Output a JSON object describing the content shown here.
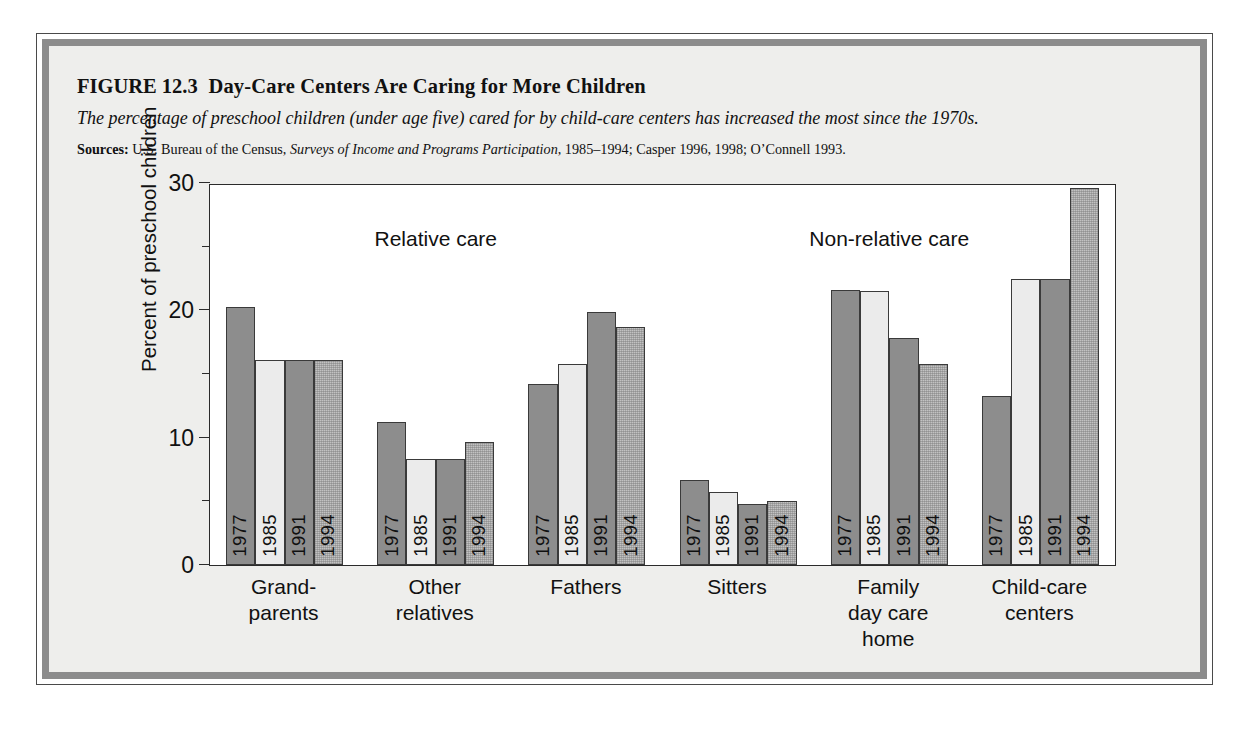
{
  "figure": {
    "label": "FIGURE 12.3",
    "title": "Day-Care Centers Are Caring for More Children",
    "subtitle": "The percentage of preschool children (under age five) cared for by child-care centers has increased the most since the 1970s.",
    "sources_label": "Sources:",
    "sources_part1": "U.S. Bureau of the Census,",
    "sources_italic": "Surveys of Income and Programs Participation",
    "sources_part2": ", 1985–1994; Casper 1996, 1998; O’Connell 1993."
  },
  "chart_data": {
    "type": "bar",
    "title": "Day-Care Centers Are Caring for More Children",
    "subtitle": "The percentage of preschool children (under age five) cared for by child-care centers has increased the most since the 1970s.",
    "xlabel": "",
    "ylabel": "Percent of preschool children",
    "ylim": [
      0,
      30
    ],
    "yticks": [
      0,
      10,
      20,
      30
    ],
    "ytick_labels": [
      "0",
      "10",
      "20",
      "30"
    ],
    "yminor_ticks": [
      5,
      15,
      25
    ],
    "grid": false,
    "legend_position": "none",
    "categories": [
      "Grand-\nparents",
      "Other\nrelatives",
      "Fathers",
      "Sitters",
      "Family\nday care\nhome",
      "Child-care\ncenters"
    ],
    "series": [
      {
        "name": "1977",
        "values": [
          20.3,
          11.2,
          14.2,
          6.7,
          21.6,
          13.3
        ],
        "color": "#8d8d8d"
      },
      {
        "name": "1985",
        "values": [
          16.1,
          8.3,
          15.8,
          5.7,
          21.5,
          22.5
        ],
        "color": "#ebebeb"
      },
      {
        "name": "1991",
        "values": [
          16.1,
          8.3,
          19.9,
          4.8,
          17.8,
          22.5
        ],
        "color": "#8d8d8d"
      },
      {
        "name": "1994",
        "values": [
          16.1,
          9.7,
          18.7,
          5.0,
          15.8,
          29.6
        ],
        "color": "#c2c2c2"
      }
    ],
    "annotations": [
      {
        "text": "Relative care",
        "group_span": [
          0,
          2
        ]
      },
      {
        "text": "Non-relative care",
        "group_span": [
          3,
          5
        ]
      }
    ]
  },
  "colors": {
    "series_1977": "#8d8d8d",
    "series_1985": "#ebebeb",
    "series_1991": "#8d8d8d",
    "series_1994": "#c2c2c2",
    "frame_band": "#8c8c8c",
    "page_background": "#eeeeec",
    "plot_background": "#ffffff",
    "axis": "#2b2b2b"
  }
}
